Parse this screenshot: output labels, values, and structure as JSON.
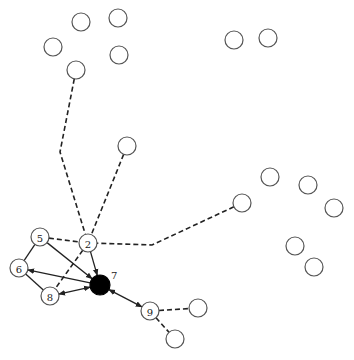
{
  "diagram": {
    "type": "network-graph",
    "node_radius": 9,
    "colors": {
      "node_stroke": "#555555",
      "node_fill": "#ffffff",
      "highlight_fill": "#000000",
      "edge": "#222222",
      "background": "#ffffff"
    },
    "nodes": [
      {
        "id": "a1",
        "x": 81,
        "y": 22,
        "label": ""
      },
      {
        "id": "a2",
        "x": 118,
        "y": 18,
        "label": ""
      },
      {
        "id": "a3",
        "x": 53,
        "y": 47,
        "label": ""
      },
      {
        "id": "a4",
        "x": 119,
        "y": 55,
        "label": ""
      },
      {
        "id": "a5",
        "x": 76,
        "y": 70,
        "label": ""
      },
      {
        "id": "b1",
        "x": 234,
        "y": 40,
        "label": ""
      },
      {
        "id": "b2",
        "x": 268,
        "y": 38,
        "label": ""
      },
      {
        "id": "c1",
        "x": 127,
        "y": 146,
        "label": ""
      },
      {
        "id": "d1",
        "x": 242,
        "y": 203,
        "label": ""
      },
      {
        "id": "d2",
        "x": 270,
        "y": 177,
        "label": ""
      },
      {
        "id": "d3",
        "x": 308,
        "y": 185,
        "label": ""
      },
      {
        "id": "d4",
        "x": 334,
        "y": 208,
        "label": ""
      },
      {
        "id": "d5",
        "x": 295,
        "y": 246,
        "label": ""
      },
      {
        "id": "d6",
        "x": 314,
        "y": 267,
        "label": ""
      },
      {
        "id": "n5",
        "x": 40,
        "y": 237,
        "label": "5"
      },
      {
        "id": "n2",
        "x": 88,
        "y": 243,
        "label": "2"
      },
      {
        "id": "n6",
        "x": 19,
        "y": 268,
        "label": "6"
      },
      {
        "id": "n8",
        "x": 50,
        "y": 296,
        "label": "8"
      },
      {
        "id": "n7",
        "x": 100,
        "y": 285,
        "label": "7",
        "filled": true,
        "external_label": true
      },
      {
        "id": "n9",
        "x": 150,
        "y": 311,
        "label": "9"
      },
      {
        "id": "e1",
        "x": 198,
        "y": 308,
        "label": ""
      },
      {
        "id": "e2",
        "x": 175,
        "y": 339,
        "label": ""
      }
    ],
    "edges": [
      {
        "from": "a5",
        "to": "n2",
        "style": "dashed",
        "via": [
          [
            60,
            152
          ]
        ]
      },
      {
        "from": "c1",
        "to": "n2",
        "style": "dashed"
      },
      {
        "from": "d1",
        "to": "n2",
        "style": "dashed",
        "via": [
          [
            152,
            245
          ]
        ]
      },
      {
        "from": "n5",
        "to": "n2",
        "style": "dashed"
      },
      {
        "from": "n2",
        "to": "n8",
        "style": "dashed"
      },
      {
        "from": "n9",
        "to": "e1",
        "style": "dashed"
      },
      {
        "from": "n9",
        "to": "e2",
        "style": "dashed"
      },
      {
        "from": "n5",
        "to": "n6",
        "style": "solid"
      },
      {
        "from": "n6",
        "to": "n8",
        "style": "solid"
      },
      {
        "from": "n5",
        "to": "n7",
        "style": "solid",
        "arrow": "end"
      },
      {
        "from": "n2",
        "to": "n7",
        "style": "solid",
        "arrow": "end"
      },
      {
        "from": "n7",
        "to": "n6",
        "style": "solid",
        "arrow": "end"
      },
      {
        "from": "n8",
        "to": "n7",
        "style": "solid",
        "arrow": "both"
      },
      {
        "from": "n7",
        "to": "n9",
        "style": "solid",
        "arrow": "both"
      }
    ]
  }
}
